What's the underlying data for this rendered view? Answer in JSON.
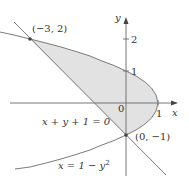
{
  "diagram": {
    "type": "region-between-curves",
    "axes": {
      "x_label": "x",
      "y_label": "y",
      "origin_label": "0",
      "x_ticks": [
        {
          "value": 1,
          "label": "1"
        }
      ],
      "y_ticks": [
        {
          "value": 1,
          "label": "1"
        },
        {
          "value": 2,
          "label": "2"
        }
      ]
    },
    "curves": [
      {
        "name": "line",
        "equation": "x + y + 1 = 0",
        "label": "x + y + 1 = 0"
      },
      {
        "name": "parabola",
        "equation": "x = 1 - y^2",
        "label": "x = 1 − y²"
      }
    ],
    "intersection_points": [
      {
        "x": -3,
        "y": 2,
        "label": "(−3, 2)"
      },
      {
        "x": 0,
        "y": -1,
        "label": "(0, −1)"
      }
    ],
    "shaded_region": "between line x+y+1=0 and parabola x=1-y^2, for -1 <= y <= 2",
    "colors": {
      "stroke": "#7a7a7a",
      "axis": "#666666",
      "shade": "#e2e2e2",
      "text": "#333333",
      "point": "#444444"
    }
  },
  "labels": {
    "x_axis": "x",
    "y_axis": "y",
    "origin": "0",
    "x_tick_1": "1",
    "y_tick_1": "1",
    "y_tick_2": "2",
    "point_a": "(−3, 2)",
    "point_b": "(0, −1)",
    "line_eq_main": "x + y + 1 = 0",
    "parab_lhs": "x = 1 − y",
    "parab_sup": "2"
  }
}
